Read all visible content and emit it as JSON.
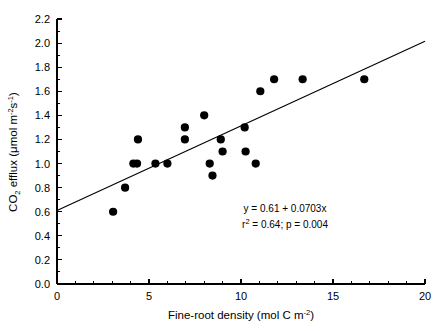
{
  "chart_data": {
    "type": "scatter",
    "title": "",
    "xlabel": "Fine-root density (mol C m-2)",
    "ylabel": "CO2 efflux (umol m-2s-1)",
    "xlim": [
      0,
      20
    ],
    "ylim": [
      0.0,
      2.2
    ],
    "grid": false,
    "legend": "none",
    "x_ticks": [
      0,
      5,
      10,
      15,
      20
    ],
    "x_tick_labels": [
      "0",
      "5",
      "10",
      "15",
      "20"
    ],
    "x_minor_tick_step": 1,
    "y_ticks": [
      0.0,
      0.2,
      0.4,
      0.6,
      0.8,
      1.0,
      1.2,
      1.4,
      1.6,
      1.8,
      2.0,
      2.2
    ],
    "y_tick_labels": [
      "0.0",
      "0.2",
      "0.4",
      "0.6",
      "0.8",
      "1.0",
      "1.2",
      "1.4",
      "1.6",
      "1.8",
      "2.0",
      "2.2"
    ],
    "y_minor_tick_step": 0.1,
    "marker": "filled-circle",
    "marker_color": "#000000",
    "points": [
      {
        "x": 3.05,
        "y": 0.6
      },
      {
        "x": 3.7,
        "y": 0.8
      },
      {
        "x": 4.15,
        "y": 1.0
      },
      {
        "x": 4.35,
        "y": 1.0
      },
      {
        "x": 4.4,
        "y": 1.2
      },
      {
        "x": 5.35,
        "y": 1.0
      },
      {
        "x": 6.0,
        "y": 1.0
      },
      {
        "x": 6.95,
        "y": 1.2
      },
      {
        "x": 6.95,
        "y": 1.3
      },
      {
        "x": 8.0,
        "y": 1.4
      },
      {
        "x": 8.3,
        "y": 1.0
      },
      {
        "x": 8.45,
        "y": 0.9
      },
      {
        "x": 8.9,
        "y": 1.2
      },
      {
        "x": 9.0,
        "y": 1.1
      },
      {
        "x": 10.2,
        "y": 1.3
      },
      {
        "x": 10.25,
        "y": 1.1
      },
      {
        "x": 10.8,
        "y": 1.0
      },
      {
        "x": 11.05,
        "y": 1.6
      },
      {
        "x": 11.8,
        "y": 1.7
      },
      {
        "x": 13.35,
        "y": 1.7
      },
      {
        "x": 16.7,
        "y": 1.7
      }
    ],
    "fit_line": {
      "type": "linear-regression",
      "intercept": 0.61,
      "slope": 0.0703,
      "x_start": 0,
      "x_end": 20,
      "color": "#000000"
    },
    "annotations": {
      "equation": "y = 0.61 + 0.0703x",
      "stats_r2_prefix": "r",
      "stats_r2_sup": "2",
      "stats_rest": " = 0.64; p = 0.004"
    }
  },
  "axis_labels": {
    "x_title_main": "Fine-root density (mol C m",
    "x_title_sup": "-2",
    "x_title_tail": ")",
    "y_title_part1": "CO",
    "y_title_sub": "2",
    "y_title_part2": " efflux (μmol m",
    "y_title_sup1": "-2",
    "y_title_part3": "s",
    "y_title_sup2": "-1",
    "y_title_tail": ")"
  }
}
